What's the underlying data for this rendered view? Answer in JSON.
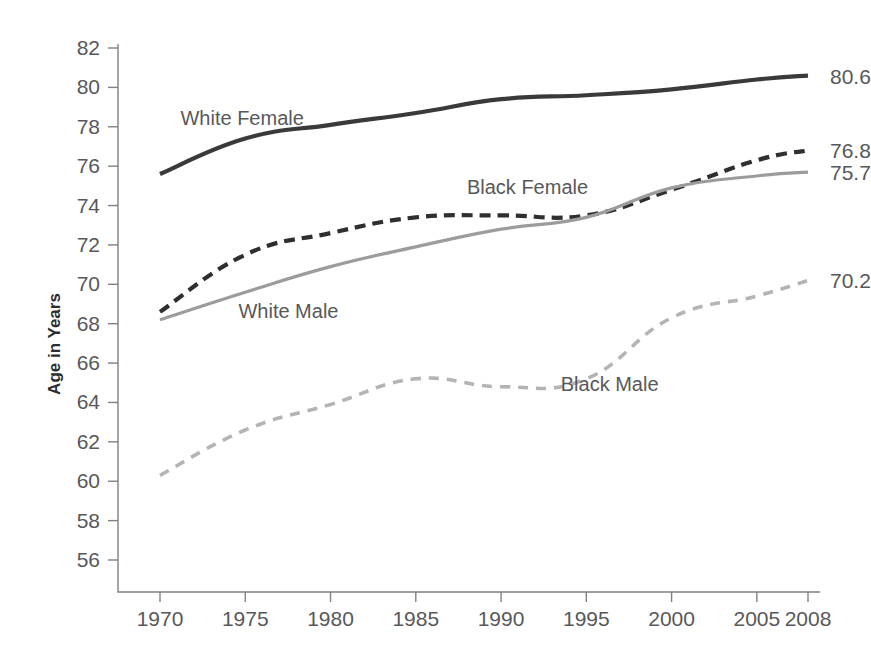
{
  "chart_data": {
    "type": "line",
    "title": "",
    "xlabel": "",
    "ylabel": "Age in Years",
    "x": [
      1970,
      1975,
      1980,
      1985,
      1990,
      1995,
      2000,
      2005,
      2008
    ],
    "xtick_labels": [
      "1970",
      "1975",
      "1980",
      "1985",
      "1990",
      "1995",
      "2000",
      "2005",
      "2008"
    ],
    "ytick_labels": [
      "56",
      "58",
      "60",
      "62",
      "64",
      "66",
      "68",
      "70",
      "72",
      "74",
      "76",
      "78",
      "80",
      "82"
    ],
    "ytick_values": [
      56,
      58,
      60,
      62,
      64,
      66,
      68,
      70,
      72,
      74,
      76,
      78,
      80,
      82
    ],
    "ylim": [
      55,
      82
    ],
    "xlim": [
      1968,
      2009
    ],
    "grid": false,
    "legend_position": "inline-annotations",
    "series": [
      {
        "name": "White Female",
        "values": [
          75.6,
          77.4,
          78.1,
          78.7,
          79.4,
          79.6,
          79.9,
          80.4,
          80.6
        ],
        "style": "solid",
        "color": "#3a3a3c",
        "width": 4.2,
        "end_label": "80.6",
        "label_x": 1971.2,
        "label_y": 78.1
      },
      {
        "name": "Black Female",
        "values": [
          68.6,
          71.5,
          72.6,
          73.4,
          73.5,
          73.5,
          74.8,
          76.3,
          76.8
        ],
        "style": "dashed",
        "color": "#2f2f31",
        "width": 4.2,
        "dash": "11,7",
        "end_label": "76.8",
        "label_x": 1988.0,
        "label_y": 74.6
      },
      {
        "name": "White Male",
        "values": [
          68.2,
          69.6,
          70.9,
          71.9,
          72.8,
          73.4,
          74.9,
          75.5,
          75.7
        ],
        "style": "solid",
        "color": "#9c9c9f",
        "width": 3.2,
        "end_label": "75.7",
        "label_x": 1974.6,
        "label_y": 68.3
      },
      {
        "name": "Black Male",
        "values": [
          60.3,
          62.6,
          63.9,
          65.2,
          64.8,
          65.2,
          68.3,
          69.4,
          70.2
        ],
        "style": "dashed",
        "color": "#b4b4b7",
        "width": 3.6,
        "dash": "10,8",
        "end_label": "70.2",
        "label_x": 1993.5,
        "label_y": 64.6
      }
    ],
    "colors": {
      "axis": "#808084",
      "tick_text": "#58585a",
      "background": "#ffffff",
      "white_female": "#3a3a3c",
      "black_female": "#2f2f31",
      "white_male": "#9c9c9f",
      "black_male": "#b4b4b7"
    }
  }
}
